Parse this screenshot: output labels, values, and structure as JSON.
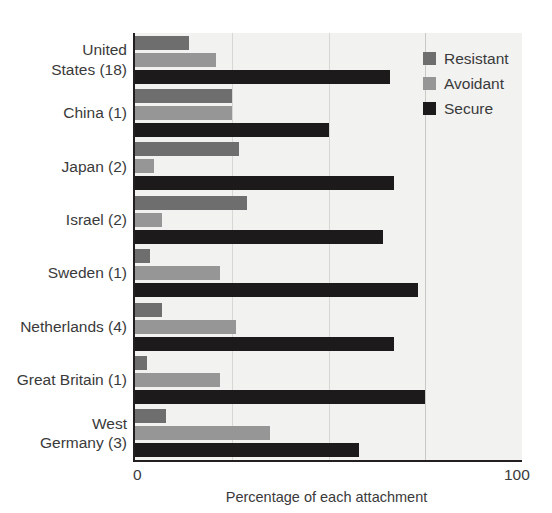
{
  "chart_data": {
    "type": "bar",
    "orientation": "horizontal",
    "title": "",
    "xlabel": "Percentage of each attachment",
    "ylabel": "",
    "xlim": [
      0,
      100
    ],
    "xticks": [
      "0",
      "100"
    ],
    "gridlines": [
      25,
      50,
      75
    ],
    "grid": true,
    "legend_position": "top-right",
    "categories": [
      "United\nStates (18)",
      "China (1)",
      "Japan (2)",
      "Israel (2)",
      "Sweden (1)",
      "Netherlands (4)",
      "Great Britain (1)",
      "West\nGermany (3)"
    ],
    "series": [
      {
        "name": "Resistant",
        "color": "#6e6e6e",
        "values": [
          14,
          25,
          27,
          29,
          4,
          7,
          3,
          8
        ]
      },
      {
        "name": "Avoidant",
        "color": "#969696",
        "values": [
          21,
          25,
          5,
          7,
          22,
          26,
          22,
          35
        ]
      },
      {
        "name": "Secure",
        "color": "#1c1a1b",
        "values": [
          66,
          50,
          67,
          64,
          73,
          67,
          75,
          58
        ]
      }
    ]
  },
  "legend": {
    "items": [
      {
        "label": "Resistant",
        "swatch": "resistant"
      },
      {
        "label": "Avoidant",
        "swatch": "avoidant"
      },
      {
        "label": "Secure",
        "swatch": "secure"
      }
    ]
  },
  "axis": {
    "x_min_label": "0",
    "x_max_label": "100",
    "x_title": "Percentage of each attachment"
  }
}
